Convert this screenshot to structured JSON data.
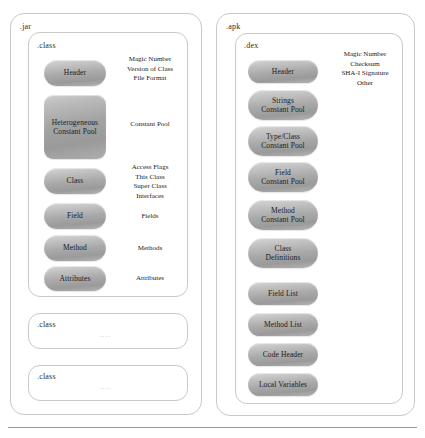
{
  "diagram": {
    "colors": {
      "pill_light": "#d8d8d8",
      "pill_dark": "#9a9a9a",
      "box_border": "#c9c9c9",
      "text": "#1a1a1a",
      "rule": "#9a9a9a"
    }
  },
  "left_panel": {
    "archive_label": ".jar",
    "primary_label": ".class",
    "blocks": [
      {
        "label": "Header",
        "shape": "pill"
      },
      {
        "label": "Heterogeneous\nConstant Pool",
        "shape": "rect"
      },
      {
        "label": "Class",
        "shape": "pill"
      },
      {
        "label": "Field",
        "shape": "pill"
      },
      {
        "label": "Method",
        "shape": "pill"
      },
      {
        "label": "Attributes",
        "shape": "pill"
      }
    ],
    "annotations": [
      "Magic Number\nVersion of Class\nFile Format",
      "Constant Pool",
      "Access Flags\nThis Class\nSuper Class\nInterfaces",
      "Fields",
      "Methods",
      "Attributes"
    ],
    "secondary_boxes": [
      {
        "label": ".class",
        "dots": "...."
      },
      {
        "label": ".class",
        "dots": "...."
      }
    ]
  },
  "right_panel": {
    "archive_label": ".apk",
    "primary_label": ".dex",
    "annotation": "Magic Number\nChecksum\nSHA-I Signature\nOther",
    "blocks": [
      {
        "label": "Header"
      },
      {
        "label": "Strings\nConstant Pool"
      },
      {
        "label": "Type/Class\nConstant Pool"
      },
      {
        "label": "Field\nConstant Pool"
      },
      {
        "label": "Method\nConstant Pool"
      },
      {
        "label": "Class\nDefinitions"
      },
      {
        "label": "Field List"
      },
      {
        "label": "Method List"
      },
      {
        "label": "Code Header"
      },
      {
        "label": "Local Variables"
      }
    ]
  }
}
